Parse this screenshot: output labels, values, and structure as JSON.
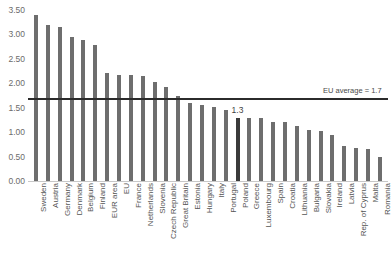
{
  "chart_data": {
    "type": "bar",
    "title": "",
    "subtitle": "",
    "xlabel": "",
    "ylabel": "",
    "ylim": [
      0,
      3.5
    ],
    "grid": false,
    "legend": "none",
    "y_ticks": [
      "0.00",
      "0.50",
      "1.00",
      "1.50",
      "2.00",
      "2.50",
      "3.00",
      "3.50"
    ],
    "y_tick_values": [
      0.0,
      0.5,
      1.0,
      1.5,
      2.0,
      2.5,
      3.0,
      3.5
    ],
    "categories": [
      "Sweden",
      "Austria",
      "Germany",
      "Denmark",
      "Belgium",
      "Finland",
      "EUR area",
      "EU",
      "France",
      "Netherlands",
      "Slovenia",
      "Czech Republic",
      "Great Britain",
      "Estonia",
      "Hungary",
      "Italy",
      "Portugal",
      "Poland",
      "Greece",
      "Luxembourg",
      "Spain",
      "Croatia",
      "Lithuania",
      "Bulgaria",
      "Slovakia",
      "Ireland",
      "Latvia",
      "Rep. of Cyprus",
      "Malta",
      "Romania"
    ],
    "values": [
      3.4,
      3.2,
      3.15,
      2.95,
      2.88,
      2.78,
      2.22,
      2.18,
      2.18,
      2.15,
      2.03,
      1.93,
      1.74,
      1.6,
      1.55,
      1.52,
      1.45,
      1.3,
      1.3,
      1.28,
      1.2,
      1.2,
      1.12,
      1.05,
      1.03,
      0.95,
      0.72,
      0.68,
      0.65,
      0.5
    ],
    "highlight_index": 17,
    "point_labels": [
      {
        "index": 17,
        "text": "1.3"
      }
    ],
    "reference_line": {
      "label": "EU average = 1.7",
      "value": 1.7
    }
  }
}
